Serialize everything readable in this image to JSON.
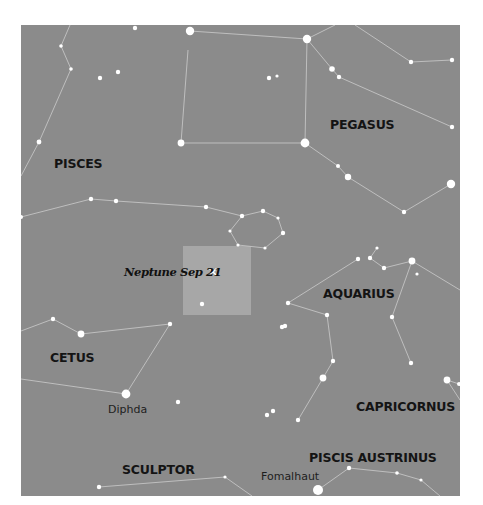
{
  "map": {
    "frame": {
      "x": 21,
      "y": 25,
      "w": 439,
      "h": 471
    },
    "colors": {
      "page_bg": "#ffffff",
      "sky": "#8b8b8b",
      "highlight_box": "#a7a7a7",
      "lines": "#c4c4c4",
      "stars": "#ffffff",
      "labels": "#141414",
      "marker": "#ffffff"
    },
    "highlight": {
      "label": "Neptune Sep 21",
      "box": {
        "x": 183,
        "y": 246,
        "w": 68,
        "h": 69
      },
      "marker": {
        "x": 213,
        "y": 272,
        "glyph": "x-marker"
      },
      "label_pos": {
        "x": 124,
        "y": 276
      }
    },
    "constellation_labels": [
      {
        "name": "PISCES",
        "x": 54,
        "y": 168
      },
      {
        "name": "PEGASUS",
        "x": 330,
        "y": 129
      },
      {
        "name": "AQUARIUS",
        "x": 323,
        "y": 298
      },
      {
        "name": "CETUS",
        "x": 50,
        "y": 362
      },
      {
        "name": "CAPRICORNUS",
        "x": 356,
        "y": 411
      },
      {
        "name": "PISCIS AUSTRINUS",
        "x": 309,
        "y": 462
      },
      {
        "name": "SCULPTOR",
        "x": 122,
        "y": 474
      }
    ],
    "star_labels": [
      {
        "name": "Diphda",
        "x": 108,
        "y": 413
      },
      {
        "name": "Fomalhaut",
        "x": 261,
        "y": 480
      }
    ],
    "lines": [
      [
        [
          70,
          25
        ],
        [
          61,
          46
        ],
        [
          71,
          69
        ],
        [
          39,
          142
        ],
        [
          21,
          176
        ]
      ],
      [
        [
          190,
          31
        ],
        [
          307,
          39
        ]
      ],
      [
        [
          188,
          50
        ],
        [
          181,
          143
        ],
        [
          305,
          143
        ],
        [
          307,
          39
        ]
      ],
      [
        [
          307,
          39
        ],
        [
          332,
          69
        ],
        [
          339,
          77
        ],
        [
          452,
          127
        ]
      ],
      [
        [
          307,
          39
        ],
        [
          335,
          25
        ]
      ],
      [
        [
          355,
          25
        ],
        [
          411,
          62
        ],
        [
          452,
          60
        ]
      ],
      [
        [
          305,
          143
        ],
        [
          338,
          166
        ],
        [
          348,
          177
        ],
        [
          404,
          212
        ],
        [
          451,
          184
        ]
      ],
      [
        [
          21,
          217
        ],
        [
          91,
          199
        ],
        [
          116,
          201
        ],
        [
          206,
          207
        ],
        [
          242,
          216
        ]
      ],
      [
        [
          242,
          216
        ],
        [
          263,
          211
        ],
        [
          278,
          218
        ],
        [
          283,
          233
        ],
        [
          265,
          248
        ],
        [
          238,
          245
        ],
        [
          230,
          231
        ],
        [
          242,
          216
        ]
      ],
      [
        [
          377,
          248
        ],
        [
          370,
          258
        ],
        [
          384,
          268
        ],
        [
          412,
          261
        ]
      ],
      [
        [
          358,
          259
        ],
        [
          288,
          303
        ],
        [
          327,
          315
        ],
        [
          333,
          361
        ],
        [
          323,
          378
        ],
        [
          298,
          420
        ]
      ],
      [
        [
          412,
          261
        ],
        [
          392,
          317
        ],
        [
          411,
          363
        ]
      ],
      [
        [
          412,
          261
        ],
        [
          460,
          290
        ]
      ],
      [
        [
          21,
          331
        ],
        [
          53,
          319
        ],
        [
          81,
          334
        ],
        [
          170,
          324
        ],
        [
          126,
          394
        ],
        [
          21,
          379
        ]
      ],
      [
        [
          447,
          380
        ],
        [
          459,
          384
        ]
      ],
      [
        [
          447,
          380
        ],
        [
          460,
          400
        ]
      ],
      [
        [
          99,
          487
        ],
        [
          225,
          477
        ],
        [
          252,
          496
        ]
      ],
      [
        [
          318,
          490
        ],
        [
          349,
          468
        ],
        [
          397,
          473
        ],
        [
          421,
          480
        ],
        [
          440,
          496
        ]
      ]
    ],
    "stars": [
      {
        "x": 135,
        "y": 28,
        "r": 2.2
      },
      {
        "x": 190,
        "y": 31,
        "r": 4.2
      },
      {
        "x": 307,
        "y": 39,
        "r": 4.2
      },
      {
        "x": 61,
        "y": 46,
        "r": 1.8
      },
      {
        "x": 71,
        "y": 69,
        "r": 1.8
      },
      {
        "x": 100,
        "y": 78,
        "r": 2.2
      },
      {
        "x": 118,
        "y": 72,
        "r": 2.2
      },
      {
        "x": 269,
        "y": 78,
        "r": 2.2
      },
      {
        "x": 277,
        "y": 76,
        "r": 1.6
      },
      {
        "x": 332,
        "y": 69,
        "r": 2.8
      },
      {
        "x": 339,
        "y": 77,
        "r": 2.2
      },
      {
        "x": 411,
        "y": 62,
        "r": 2.2
      },
      {
        "x": 452,
        "y": 60,
        "r": 2.2
      },
      {
        "x": 452,
        "y": 127,
        "r": 2.2
      },
      {
        "x": 39,
        "y": 142,
        "r": 2.4
      },
      {
        "x": 181,
        "y": 143,
        "r": 3.4
      },
      {
        "x": 305,
        "y": 143,
        "r": 4.4
      },
      {
        "x": 338,
        "y": 166,
        "r": 2.0
      },
      {
        "x": 348,
        "y": 177,
        "r": 3.2
      },
      {
        "x": 451,
        "y": 184,
        "r": 4.2
      },
      {
        "x": 404,
        "y": 212,
        "r": 2.2
      },
      {
        "x": 21,
        "y": 217,
        "r": 2.0
      },
      {
        "x": 91,
        "y": 199,
        "r": 2.2
      },
      {
        "x": 116,
        "y": 201,
        "r": 2.2
      },
      {
        "x": 206,
        "y": 207,
        "r": 2.2
      },
      {
        "x": 242,
        "y": 216,
        "r": 2.2
      },
      {
        "x": 263,
        "y": 211,
        "r": 2.2
      },
      {
        "x": 278,
        "y": 218,
        "r": 1.6
      },
      {
        "x": 283,
        "y": 233,
        "r": 2.2
      },
      {
        "x": 265,
        "y": 248,
        "r": 1.6
      },
      {
        "x": 238,
        "y": 245,
        "r": 1.6
      },
      {
        "x": 230,
        "y": 231,
        "r": 1.6
      },
      {
        "x": 202,
        "y": 304,
        "r": 2.2
      },
      {
        "x": 377,
        "y": 248,
        "r": 1.6
      },
      {
        "x": 358,
        "y": 259,
        "r": 2.2
      },
      {
        "x": 370,
        "y": 258,
        "r": 2.2
      },
      {
        "x": 384,
        "y": 268,
        "r": 2.2
      },
      {
        "x": 412,
        "y": 261,
        "r": 3.4
      },
      {
        "x": 417,
        "y": 274,
        "r": 1.6
      },
      {
        "x": 288,
        "y": 303,
        "r": 2.2
      },
      {
        "x": 327,
        "y": 315,
        "r": 2.2
      },
      {
        "x": 282,
        "y": 327,
        "r": 2.2
      },
      {
        "x": 285,
        "y": 326,
        "r": 2.2
      },
      {
        "x": 392,
        "y": 317,
        "r": 2.2
      },
      {
        "x": 333,
        "y": 361,
        "r": 2.2
      },
      {
        "x": 411,
        "y": 363,
        "r": 2.2
      },
      {
        "x": 323,
        "y": 378,
        "r": 3.4
      },
      {
        "x": 298,
        "y": 420,
        "r": 2.2
      },
      {
        "x": 53,
        "y": 319,
        "r": 2.2
      },
      {
        "x": 81,
        "y": 334,
        "r": 3.4
      },
      {
        "x": 170,
        "y": 324,
        "r": 2.2
      },
      {
        "x": 126,
        "y": 394,
        "r": 4.4
      },
      {
        "x": 178,
        "y": 402,
        "r": 2.2
      },
      {
        "x": 267,
        "y": 415,
        "r": 2.2
      },
      {
        "x": 273,
        "y": 411,
        "r": 2.2
      },
      {
        "x": 447,
        "y": 380,
        "r": 3.4
      },
      {
        "x": 459,
        "y": 384,
        "r": 2.0
      },
      {
        "x": 99,
        "y": 487,
        "r": 2.2
      },
      {
        "x": 225,
        "y": 477,
        "r": 1.6
      },
      {
        "x": 318,
        "y": 490,
        "r": 5.0
      },
      {
        "x": 349,
        "y": 468,
        "r": 2.2
      },
      {
        "x": 397,
        "y": 473,
        "r": 1.8
      },
      {
        "x": 421,
        "y": 480,
        "r": 1.6
      }
    ]
  }
}
